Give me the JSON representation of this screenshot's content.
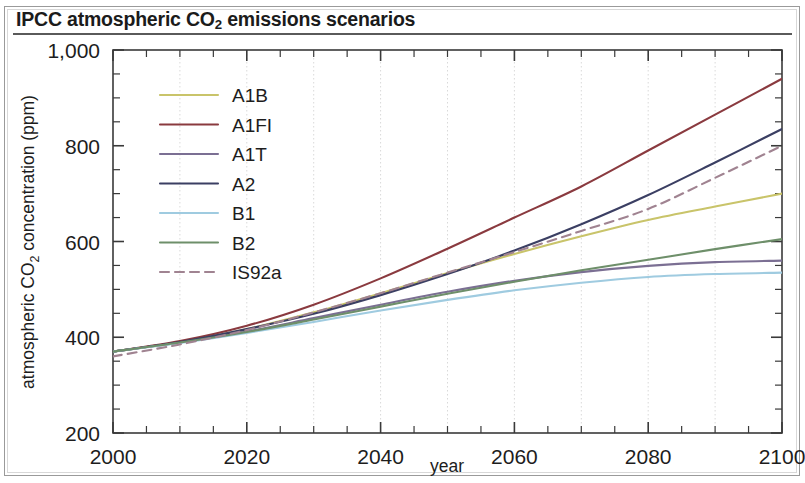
{
  "figure": {
    "title_prefix": "IPCC atmospheric CO",
    "title_sub": "2",
    "title_suffix": " emissions scenarios",
    "title_full": "IPCC atmospheric CO2 emissions scenarios",
    "background": "#ffffff",
    "frame_color": "#9a9a9a"
  },
  "chart_data": {
    "type": "line",
    "title": "IPCC atmospheric CO2 emissions scenarios",
    "xlabel": "year",
    "ylabel": "atmospheric CO2 concentration (ppm)",
    "ylabel_prefix": "atmospheric CO",
    "ylabel_sub": "2",
    "ylabel_suffix": " concentration (ppm)",
    "xlim": [
      2000,
      2100
    ],
    "ylim": [
      200,
      1000
    ],
    "xticks": [
      2000,
      2020,
      2040,
      2060,
      2080,
      2100
    ],
    "xtick_labels": [
      "2000",
      "2020",
      "2040",
      "2060",
      "2080",
      "2100"
    ],
    "xtick_minor_step": 5,
    "yticks": [
      200,
      400,
      600,
      800,
      1000
    ],
    "ytick_labels": [
      "200",
      "400",
      "600",
      "800",
      "1,000"
    ],
    "ytick_minor_step": 50,
    "grid": {
      "vertical": true,
      "horizontal": false,
      "step": 10,
      "color": "#d9d9d9",
      "style": "dotted"
    },
    "legend_position": "upper left",
    "x": [
      2000,
      2010,
      2020,
      2030,
      2040,
      2050,
      2060,
      2070,
      2080,
      2090,
      2100
    ],
    "series": [
      {
        "name": "A1B",
        "color": "#c9c46a",
        "dash": "none",
        "values": [
          370,
          390,
          417,
          452,
          492,
          534,
          574,
          611,
          645,
          673,
          700
        ]
      },
      {
        "name": "A1FI",
        "color": "#8a3a3f",
        "dash": "none",
        "values": [
          370,
          392,
          424,
          468,
          523,
          585,
          650,
          715,
          790,
          865,
          940
        ]
      },
      {
        "name": "A1T",
        "color": "#7b6f93",
        "dash": "none",
        "values": [
          370,
          389,
          412,
          440,
          468,
          495,
          518,
          536,
          549,
          557,
          560
        ]
      },
      {
        "name": "A2",
        "color": "#3b3f63",
        "dash": "none",
        "values": [
          370,
          390,
          417,
          449,
          488,
          532,
          581,
          636,
          697,
          765,
          835
        ]
      },
      {
        "name": "B1",
        "color": "#9fcbe0",
        "dash": "none",
        "values": [
          370,
          388,
          409,
          432,
          456,
          478,
          498,
          514,
          526,
          532,
          535
        ]
      },
      {
        "name": "B2",
        "color": "#6e8f6a",
        "dash": "none",
        "values": [
          370,
          389,
          411,
          437,
          464,
          491,
          516,
          540,
          562,
          584,
          605
        ]
      },
      {
        "name": "IS92a",
        "color": "#a08391",
        "dash": "dashed",
        "values": [
          360,
          385,
          415,
          452,
          492,
          535,
          578,
          622,
          668,
          733,
          800
        ]
      }
    ]
  }
}
